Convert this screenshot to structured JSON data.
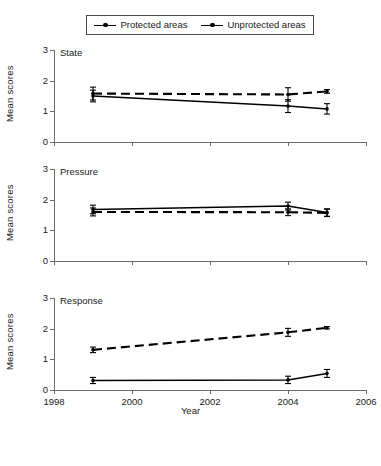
{
  "legend": {
    "entries": [
      {
        "label": "Protected areas",
        "style": "solid",
        "color": "#000000"
      },
      {
        "label": "Unprotected areas",
        "style": "dashed",
        "color": "#000000"
      }
    ]
  },
  "axis": {
    "y_label": "Mean scores",
    "x_label": "Year",
    "y_ticks": [
      "0",
      "1",
      "2",
      "3"
    ],
    "x_ticks": [
      "1998",
      "2000",
      "2002",
      "2004",
      "2006"
    ]
  },
  "chart_data": [
    {
      "type": "line",
      "title": "State",
      "xlabel": "Year",
      "ylabel": "Mean scores",
      "xlim": [
        1998,
        2006
      ],
      "ylim": [
        0,
        3
      ],
      "x": [
        1999,
        2004,
        2005
      ],
      "grid": false,
      "legend_position": "top",
      "series": [
        {
          "name": "Protected areas",
          "style": "solid",
          "values": [
            1.5,
            1.17,
            1.08
          ],
          "errors": [
            0.19,
            0.21,
            0.17
          ]
        },
        {
          "name": "Unprotected areas",
          "style": "dashed",
          "values": [
            1.58,
            1.55,
            1.65
          ],
          "errors": [
            0.21,
            0.22,
            0.06
          ]
        }
      ]
    },
    {
      "type": "line",
      "title": "Pressure",
      "xlabel": "Year",
      "ylabel": "Mean scores",
      "xlim": [
        1998,
        2006
      ],
      "ylim": [
        0,
        3
      ],
      "x": [
        1999,
        2004,
        2005
      ],
      "grid": false,
      "legend_position": "top",
      "series": [
        {
          "name": "Protected areas",
          "style": "solid",
          "values": [
            1.68,
            1.79,
            1.58
          ],
          "errors": [
            0.14,
            0.13,
            0.12
          ]
        },
        {
          "name": "Unprotected areas",
          "style": "dashed",
          "values": [
            1.6,
            1.59,
            1.57
          ],
          "errors": [
            0.13,
            0.11,
            0.12
          ]
        }
      ]
    },
    {
      "type": "line",
      "title": "Response",
      "xlabel": "Year",
      "ylabel": "Mean scores",
      "xlim": [
        1998,
        2006
      ],
      "ylim": [
        0,
        3
      ],
      "x": [
        1999,
        2004,
        2005
      ],
      "grid": false,
      "legend_position": "top",
      "series": [
        {
          "name": "Protected areas",
          "style": "solid",
          "values": [
            0.31,
            0.33,
            0.54
          ],
          "errors": [
            0.1,
            0.12,
            0.13
          ]
        },
        {
          "name": "Unprotected areas",
          "style": "dashed",
          "values": [
            1.31,
            1.88,
            2.03
          ],
          "errors": [
            0.09,
            0.13,
            0.04
          ]
        }
      ]
    }
  ]
}
